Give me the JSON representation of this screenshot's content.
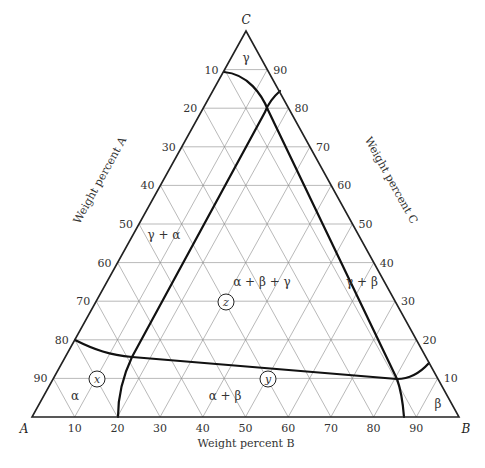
{
  "diagram": {
    "type": "ternary phase diagram",
    "vertices": {
      "A": "A",
      "B": "B",
      "C": "C"
    },
    "axis_titles": {
      "A": "Weight percent A",
      "B": "Weight percent B",
      "C": "Weight percent C"
    },
    "ticks": {
      "A": [
        "10",
        "20",
        "30",
        "40",
        "50",
        "60",
        "70",
        "80",
        "90"
      ],
      "B": [
        "10",
        "20",
        "30",
        "40",
        "50",
        "60",
        "70",
        "80",
        "90"
      ],
      "C": [
        "10",
        "20",
        "30",
        "40",
        "50",
        "60",
        "70",
        "80",
        "90"
      ]
    },
    "phase_regions": [
      {
        "id": "gamma",
        "label": "γ"
      },
      {
        "id": "gamma-alpha",
        "label": "γ + α"
      },
      {
        "id": "alpha-beta-gamma",
        "label": "α + β + γ"
      },
      {
        "id": "gamma-beta",
        "label": "γ + β"
      },
      {
        "id": "alpha",
        "label": "α"
      },
      {
        "id": "alpha-beta",
        "label": "α + β"
      },
      {
        "id": "beta",
        "label": "β"
      }
    ],
    "points": [
      {
        "label": "x",
        "A": 80,
        "B": 10,
        "C": 10
      },
      {
        "label": "y",
        "A": 40,
        "B": 50,
        "C": 10
      },
      {
        "label": "z",
        "A": 40,
        "B": 30,
        "C": 30
      }
    ],
    "colors": {
      "lines": "#111111",
      "grid": "#8a8a8a",
      "background": "#ffffff"
    }
  }
}
